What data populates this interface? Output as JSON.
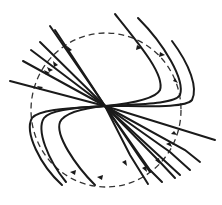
{
  "diagram": {
    "title": "",
    "colors": {
      "line": "#1a1a1a",
      "boundary": "#333333",
      "background": "#ffffff"
    },
    "center": {
      "x": 105,
      "y": 106
    },
    "boundary_circle": {
      "cx": 106,
      "cy": 110,
      "r": 76,
      "style": "dashed"
    },
    "straight_lines_count": 9,
    "curved_lines_count": 6,
    "arrowheads": "on each line near the dashed circle, pointing toward the center"
  }
}
